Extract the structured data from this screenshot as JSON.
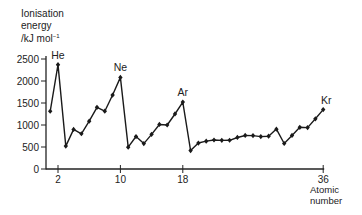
{
  "chart_data": {
    "type": "line",
    "title": "",
    "ylabel": "Ionisation energy /kJ mol-1",
    "ylabel_lines": [
      "Ionisation",
      "energy",
      "/kJ mol"
    ],
    "ylabel_superscript": "−1",
    "xlabel": "Atomic number",
    "xlabel_lines": [
      "Atomic",
      "number"
    ],
    "xlim": [
      1,
      36
    ],
    "ylim": [
      0,
      2500
    ],
    "x_ticks": [
      2,
      10,
      18,
      36
    ],
    "y_ticks": [
      0,
      500,
      1000,
      1500,
      2000,
      2500
    ],
    "grid": false,
    "legend": null,
    "annotations": [
      {
        "label": "He",
        "x": 2,
        "y": 2372
      },
      {
        "label": "Ne",
        "x": 10,
        "y": 2081
      },
      {
        "label": "Ar",
        "x": 18,
        "y": 1521
      },
      {
        "label": "Kr",
        "x": 36,
        "y": 1351
      }
    ],
    "series": [
      {
        "name": "First ionisation energy",
        "x": [
          1,
          2,
          3,
          4,
          5,
          6,
          7,
          8,
          9,
          10,
          11,
          12,
          13,
          14,
          15,
          16,
          17,
          18,
          19,
          20,
          21,
          22,
          23,
          24,
          25,
          26,
          27,
          28,
          29,
          30,
          31,
          32,
          33,
          34,
          35,
          36
        ],
        "values": [
          1312,
          2372,
          520,
          899,
          801,
          1086,
          1402,
          1314,
          1681,
          2081,
          496,
          738,
          578,
          787,
          1012,
          1000,
          1251,
          1521,
          419,
          590,
          633,
          659,
          651,
          653,
          717,
          762,
          760,
          737,
          746,
          906,
          579,
          762,
          947,
          941,
          1140,
          1351
        ]
      }
    ]
  }
}
